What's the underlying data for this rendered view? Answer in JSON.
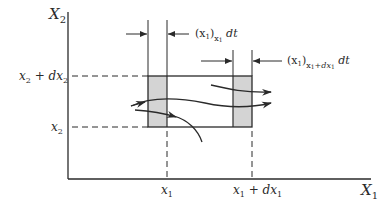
{
  "diagram": {
    "type": "flux-control-volume",
    "axes": {
      "x": {
        "label": "X",
        "sub": "1"
      },
      "y": {
        "label": "X",
        "sub": "2"
      }
    },
    "ticks": {
      "x_left": {
        "main": "x",
        "sub": "1"
      },
      "x_right": {
        "main": "x",
        "sub": "1",
        "plus": " + d",
        "main2": "x",
        "sub2": "1"
      },
      "y_bottom": {
        "main": "x",
        "sub": "2"
      },
      "y_top": {
        "main": "x",
        "sub": "2",
        "plus": " + d",
        "main2": "x",
        "sub2": "2"
      }
    },
    "annotations": {
      "inflow": {
        "paren": "(x",
        "paren_sub": "1",
        "close": ")",
        "outer_sub": "x",
        "outer_sub_sub": "1",
        "tail": " dt"
      },
      "outflow": {
        "paren": "(x",
        "paren_sub": "1",
        "close": ")",
        "outer_sub": "x",
        "outer_sub_sub": "1",
        "outer_sub_tail": "+dx",
        "outer_sub_tail_sub": "1",
        "tail": " dt"
      }
    },
    "colors": {
      "line": "#2a2a2a",
      "shade": "#d4d4d4",
      "background": "#ffffff"
    }
  }
}
